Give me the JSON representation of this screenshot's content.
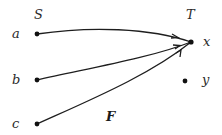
{
  "diagram": {
    "type": "function-mapping",
    "domain_set": {
      "label": "S",
      "elements": [
        {
          "id": "a",
          "label": "a"
        },
        {
          "id": "b",
          "label": "b"
        },
        {
          "id": "c",
          "label": "c"
        }
      ]
    },
    "codomain_set": {
      "label": "T",
      "elements": [
        {
          "id": "x",
          "label": "x"
        },
        {
          "id": "y",
          "label": "y"
        }
      ]
    },
    "function_label": "F",
    "mappings": [
      {
        "from": "a",
        "to": "x"
      },
      {
        "from": "b",
        "to": "x"
      },
      {
        "from": "c",
        "to": "x"
      }
    ],
    "colors": {
      "ink": "#1e1e1e",
      "background": "#ffffff"
    }
  }
}
